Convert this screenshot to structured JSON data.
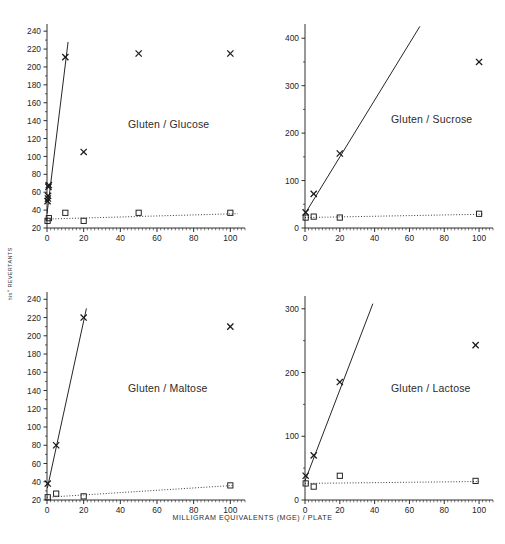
{
  "figure": {
    "ylabel": "his+ REVERTANTS",
    "ylabel_prefix": "his",
    "ylabel_sup": "+",
    "ylabel_rest": " REVERTANTS",
    "xlabel": "MILLIGRAM EQUIVALENTS (MGE)  /  PLATE",
    "ink_color": "#1a1a1a",
    "background": "#ffffff"
  },
  "chart_data": [
    {
      "type": "scatter",
      "title": "Gluten / Glucose",
      "xlabel": "MILLIGRAM EQUIVALENTS (MGE) / PLATE",
      "ylabel": "his+ REVERTANTS",
      "xlim": [
        0,
        108
      ],
      "ylim": [
        20,
        248
      ],
      "xticks": [
        0,
        20,
        40,
        60,
        80,
        100
      ],
      "yticks": [
        20,
        40,
        60,
        80,
        100,
        120,
        140,
        160,
        180,
        200,
        220,
        240
      ],
      "grid": false,
      "legend": "none",
      "series": [
        {
          "name": "with S9 (cross)",
          "marker": "x",
          "points": [
            {
              "x": 0.3,
              "y": 50
            },
            {
              "x": 0.5,
              "y": 53
            },
            {
              "x": 0.6,
              "y": 56
            },
            {
              "x": 0.8,
              "y": 66
            },
            {
              "x": 1.0,
              "y": 68
            },
            {
              "x": 10,
              "y": 211
            },
            {
              "x": 20,
              "y": 105
            },
            {
              "x": 50,
              "y": 215
            },
            {
              "x": 100,
              "y": 215
            }
          ],
          "fit_line": {
            "style": "solid",
            "x0": 0.0,
            "y0": 36,
            "x1": 11.5,
            "y1": 228
          }
        },
        {
          "name": "without S9 (square)",
          "marker": "square",
          "points": [
            {
              "x": 0.3,
              "y": 28
            },
            {
              "x": 1.0,
              "y": 31
            },
            {
              "x": 10,
              "y": 37
            },
            {
              "x": 20,
              "y": 28
            },
            {
              "x": 50,
              "y": 37
            },
            {
              "x": 100,
              "y": 37
            }
          ],
          "fit_line": {
            "style": "dotted",
            "x0": 0.0,
            "y0": 30,
            "x1": 104,
            "y1": 36
          }
        }
      ]
    },
    {
      "type": "scatter",
      "title": "Gluten / Sucrose",
      "xlabel": "MILLIGRAM EQUIVALENTS (MGE) / PLATE",
      "ylabel": "his+ REVERTANTS",
      "xlim": [
        0,
        108
      ],
      "ylim": [
        0,
        430
      ],
      "xticks": [
        0,
        20,
        40,
        60,
        80,
        100
      ],
      "yticks": [
        0,
        100,
        200,
        300,
        400
      ],
      "grid": false,
      "legend": "none",
      "series": [
        {
          "name": "with S9 (cross)",
          "marker": "x",
          "points": [
            {
              "x": 0.4,
              "y": 33
            },
            {
              "x": 5,
              "y": 72
            },
            {
              "x": 20,
              "y": 157
            },
            {
              "x": 100,
              "y": 350
            }
          ],
          "fit_line": {
            "style": "solid",
            "x0": 0.0,
            "y0": 30,
            "x1": 66,
            "y1": 425
          }
        },
        {
          "name": "without S9 (square)",
          "marker": "square",
          "points": [
            {
              "x": 0.4,
              "y": 22
            },
            {
              "x": 5,
              "y": 24
            },
            {
              "x": 20,
              "y": 22
            },
            {
              "x": 100,
              "y": 30
            }
          ],
          "fit_line": {
            "style": "dotted",
            "x0": 0.0,
            "y0": 22,
            "x1": 102,
            "y1": 29
          }
        }
      ]
    },
    {
      "type": "scatter",
      "title": "Gluten / Maltose",
      "xlabel": "MILLIGRAM EQUIVALENTS (MGE) / PLATE",
      "ylabel": "his+ REVERTANTS",
      "xlim": [
        0,
        108
      ],
      "ylim": [
        20,
        248
      ],
      "xticks": [
        0,
        20,
        40,
        60,
        80,
        100
      ],
      "yticks": [
        20,
        40,
        60,
        80,
        100,
        120,
        140,
        160,
        180,
        200,
        220,
        240
      ],
      "grid": false,
      "legend": "none",
      "series": [
        {
          "name": "with S9 (cross)",
          "marker": "x",
          "points": [
            {
              "x": 0.4,
              "y": 38
            },
            {
              "x": 5,
              "y": 80
            },
            {
              "x": 20,
              "y": 220
            },
            {
              "x": 100,
              "y": 210
            }
          ],
          "fit_line": {
            "style": "solid",
            "x0": 0.2,
            "y0": 33,
            "x1": 21.5,
            "y1": 230
          }
        },
        {
          "name": "without S9 (square)",
          "marker": "square",
          "points": [
            {
              "x": 0.4,
              "y": 23
            },
            {
              "x": 5,
              "y": 27
            },
            {
              "x": 20,
              "y": 24
            },
            {
              "x": 100,
              "y": 36
            }
          ],
          "fit_line": {
            "style": "dotted",
            "x0": 0.0,
            "y0": 23,
            "x1": 102,
            "y1": 36
          }
        }
      ]
    },
    {
      "type": "scatter",
      "title": "Gluten / Lactose",
      "xlabel": "MILLIGRAM EQUIVALENTS (MGE) / PLATE",
      "ylabel": "his+ REVERTANTS",
      "xlim": [
        0,
        108
      ],
      "ylim": [
        0,
        320
      ],
      "xticks": [
        0,
        20,
        40,
        60,
        80,
        100
      ],
      "yticks": [
        0,
        100,
        200,
        300
      ],
      "grid": false,
      "legend": "none",
      "series": [
        {
          "name": "with S9 (cross)",
          "marker": "x",
          "points": [
            {
              "x": 0.4,
              "y": 38
            },
            {
              "x": 5,
              "y": 70
            },
            {
              "x": 20,
              "y": 185
            },
            {
              "x": 98,
              "y": 243
            }
          ],
          "fit_line": {
            "style": "solid",
            "x0": 0.0,
            "y0": 30,
            "x1": 39,
            "y1": 308
          }
        },
        {
          "name": "without S9 (square)",
          "marker": "square",
          "points": [
            {
              "x": 0.4,
              "y": 26
            },
            {
              "x": 5,
              "y": 21
            },
            {
              "x": 20,
              "y": 38
            },
            {
              "x": 98,
              "y": 30
            }
          ],
          "fit_line": {
            "style": "dotted",
            "x0": 0.0,
            "y0": 26,
            "x1": 100,
            "y1": 29
          }
        }
      ]
    }
  ]
}
